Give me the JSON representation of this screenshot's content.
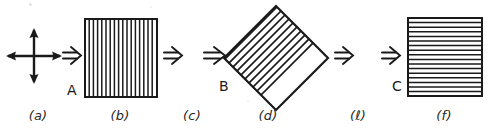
{
  "figure": {
    "width": 504,
    "height": 133,
    "background": "#ffffff",
    "ink": "#1a1a1a",
    "caption_color": "#262626"
  },
  "panels": [
    {
      "id": "a",
      "caption": "(a)",
      "caption_x": 38,
      "caption_y": 108,
      "kind": "cross-arrows",
      "center_x": 34,
      "center_y": 56,
      "arm": 27,
      "description": "four-headed cross of double arrows"
    },
    {
      "id": "b",
      "caption": "(b)",
      "caption_x": 120,
      "caption_y": 108,
      "kind": "square",
      "x": 84,
      "y": 18,
      "w": 74,
      "h": 80,
      "stripes": "vertical",
      "stripe_count": 17,
      "vertex_label": "A",
      "vertex_label_x": 67,
      "vertex_label_y": 82
    },
    {
      "id": "c",
      "caption": "(c)",
      "caption_x": 192,
      "caption_y": 108,
      "kind": "caption-only"
    },
    {
      "id": "d",
      "caption": "(d)",
      "caption_x": 268,
      "caption_y": 108,
      "kind": "diamond",
      "cx": 276,
      "cy": 58,
      "rx": 52,
      "ry": 52,
      "stripes": "diagonal-ne",
      "stripe_count": 18,
      "vertex_label": "B",
      "vertex_label_x": 219,
      "vertex_label_y": 80
    },
    {
      "id": "e",
      "caption": "(ℓ)",
      "caption_x": 358,
      "caption_y": 108,
      "kind": "caption-only"
    },
    {
      "id": "f",
      "caption": "(f)",
      "caption_x": 444,
      "caption_y": 108,
      "kind": "square",
      "x": 407,
      "y": 17,
      "w": 76,
      "h": 80,
      "stripes": "horizontal",
      "stripe_count": 16,
      "vertex_label": "C",
      "vertex_label_x": 392,
      "vertex_label_y": 80
    }
  ],
  "arrows": [
    {
      "id": "arrow-1",
      "glyph": "⇒",
      "x": 62,
      "y": 45,
      "label": "double-arrow-right"
    },
    {
      "id": "arrow-2",
      "glyph": "⇒",
      "x": 163,
      "y": 45,
      "label": "double-arrow-right"
    },
    {
      "id": "arrow-3",
      "glyph": "⇒",
      "x": 203,
      "y": 45,
      "label": "double-arrow-right"
    },
    {
      "id": "arrow-4",
      "glyph": "⇒",
      "x": 334,
      "y": 45,
      "label": "double-arrow-right"
    },
    {
      "id": "arrow-5",
      "glyph": "⇒",
      "x": 381,
      "y": 45,
      "label": "double-arrow-right"
    }
  ],
  "cross": {
    "arrow_count": 4,
    "directions": [
      "up",
      "down",
      "left",
      "right"
    ]
  }
}
